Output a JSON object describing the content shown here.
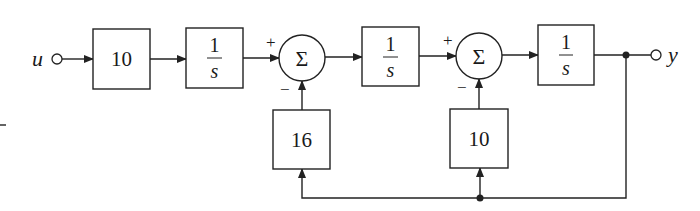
{
  "diagram": {
    "type": "block-diagram",
    "input": {
      "label": "u"
    },
    "output": {
      "label": "y"
    },
    "forward_blocks": [
      {
        "id": "gain",
        "numerator": "10",
        "denominator": ""
      },
      {
        "id": "int1",
        "numerator": "1",
        "denominator": "s"
      },
      {
        "id": "int2",
        "numerator": "1",
        "denominator": "s"
      },
      {
        "id": "int3",
        "numerator": "1",
        "denominator": "s"
      }
    ],
    "summing_junctions": [
      {
        "id": "sum1",
        "symbol": "Σ",
        "plus_sign": "+",
        "minus_sign": "−"
      },
      {
        "id": "sum2",
        "symbol": "Σ",
        "plus_sign": "+",
        "minus_sign": "−"
      }
    ],
    "feedback_blocks": [
      {
        "id": "fb1",
        "gain": "16",
        "to": "sum1"
      },
      {
        "id": "fb2",
        "gain": "10",
        "to": "sum2"
      }
    ],
    "colors": {
      "stroke": "#222222",
      "background": "#ffffff"
    }
  }
}
